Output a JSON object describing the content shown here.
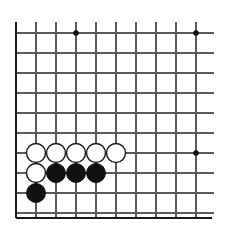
{
  "figure": {
    "kind": "go-board-diagram",
    "board_colors": {
      "background": "#ffffff",
      "grid_line": "#5a5a5a",
      "edge_line": "#1a1a1a",
      "star_point": "#111111",
      "black_stone_fill": "#111111",
      "white_stone_fill": "#ffffff",
      "white_stone_outline": "#1a1a1a"
    }
  },
  "board": {
    "visible_columns": 10,
    "visible_rows": 10,
    "cell_size": 20,
    "origin_x": 16,
    "origin_y": 33,
    "stone_radius": 9.5,
    "star_radius": 2.8,
    "edges": [
      {
        "name": "left-edge",
        "x1": 16,
        "y1": 22,
        "x2": 16,
        "y2": 218
      },
      {
        "name": "bottom-edge",
        "x1": 16,
        "y1": 218,
        "x2": 212,
        "y2": 218
      }
    ],
    "vertical_lines_x": [
      16,
      36,
      56,
      76,
      96,
      116,
      136,
      156,
      176,
      196
    ],
    "vertical_line_top_y": 22,
    "vertical_line_bottom_y": 218,
    "horizontal_lines_y": [
      33,
      53,
      73,
      93,
      113,
      133,
      153,
      173,
      193,
      213
    ],
    "horizontal_line_left_x": 16,
    "horizontal_line_right_x": 214,
    "star_points": [
      {
        "name": "star-point-top-left",
        "col": 4,
        "row": 1,
        "x": 76,
        "y": 33
      },
      {
        "name": "star-point-top-right",
        "col": 10,
        "row": 1,
        "x": 196,
        "y": 33
      },
      {
        "name": "star-point-right",
        "col": 10,
        "row": 7,
        "x": 196,
        "y": 153
      }
    ],
    "stones": [
      {
        "name": "white-stone-c2r7",
        "color": "white",
        "col": 2,
        "row": 7,
        "x": 36,
        "y": 153
      },
      {
        "name": "white-stone-c3r7",
        "color": "white",
        "col": 3,
        "row": 7,
        "x": 56,
        "y": 153
      },
      {
        "name": "white-stone-c4r7",
        "color": "white",
        "col": 4,
        "row": 7,
        "x": 76,
        "y": 153
      },
      {
        "name": "white-stone-c5r7",
        "color": "white",
        "col": 5,
        "row": 7,
        "x": 96,
        "y": 153
      },
      {
        "name": "white-stone-c6r7",
        "color": "white",
        "col": 6,
        "row": 7,
        "x": 116,
        "y": 153
      },
      {
        "name": "white-stone-c2r8",
        "color": "white",
        "col": 2,
        "row": 8,
        "x": 36,
        "y": 173
      },
      {
        "name": "black-stone-c3r8",
        "color": "black",
        "col": 3,
        "row": 8,
        "x": 56,
        "y": 173
      },
      {
        "name": "black-stone-c4r8",
        "color": "black",
        "col": 4,
        "row": 8,
        "x": 76,
        "y": 173
      },
      {
        "name": "black-stone-c5r8",
        "color": "black",
        "col": 5,
        "row": 8,
        "x": 96,
        "y": 173
      },
      {
        "name": "black-stone-c2r9",
        "color": "black",
        "col": 2,
        "row": 9,
        "x": 36,
        "y": 193
      }
    ],
    "stone_counts": {
      "black": 4,
      "white": 6
    }
  }
}
